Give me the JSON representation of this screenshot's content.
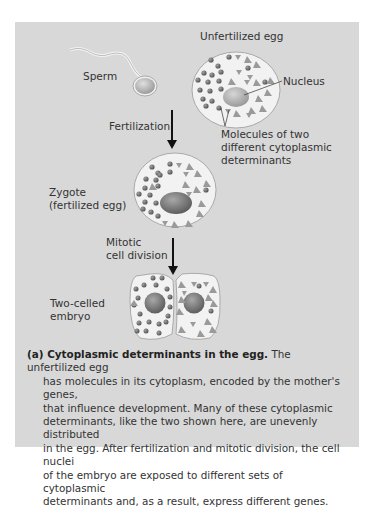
{
  "figure": {
    "labels": {
      "unfertilized_egg": "Unfertilized egg",
      "sperm": "Sperm",
      "nucleus": "Nucleus",
      "fertilization": "Fertilization",
      "molecules_line1": "Molecules of two",
      "molecules_line2": "different cytoplasmic",
      "molecules_line3": "determinants",
      "zygote_line1": "Zygote",
      "zygote_line2": "(fertilized egg)",
      "mitotic_line1": "Mitotic",
      "mitotic_line2": "cell division",
      "two_celled_line1": "Two-celled",
      "two_celled_line2": "embryo"
    },
    "caption": {
      "title": "(a) Cytoplasmic determinants in the egg.",
      "body_first": "The unfertilized egg",
      "lines": [
        "has molecules in its cytoplasm, encoded by the mother's genes,",
        "that influence development. Many of these cytoplasmic",
        "determinants, like the two shown here, are unevenly distributed",
        "in the egg. After fertilization and mitotic division, the cell nuclei",
        "of the embryo are exposed to different sets of cytoplasmic",
        "determinants and, as a result, express different genes."
      ]
    },
    "colors": {
      "panel_bg": "#d8d8d8",
      "cell_fill": "#f2f2f2",
      "nucleus": "#7a7a7a",
      "determinant_circle": "#6e6e6e",
      "determinant_triangle": "#9a9a9a"
    }
  }
}
